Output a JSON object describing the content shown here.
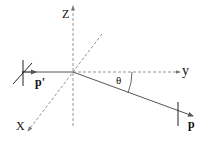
{
  "diagram": {
    "axes": {
      "z_label": "Z",
      "y_label": "y",
      "x_label": "X"
    },
    "vectors": {
      "incoming_label": "p'",
      "outgoing_label": "p"
    },
    "angle_label": "θ",
    "colors": {
      "axis": "#777777",
      "vector": "#555555",
      "plane": "#222222",
      "text": "#111111"
    }
  }
}
